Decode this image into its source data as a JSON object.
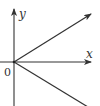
{
  "diagram": {
    "type": "coordinate-axes-with-rays",
    "axes": {
      "x_label": "x",
      "y_label": "y",
      "origin_label": "0"
    },
    "rays": [
      {
        "name": "upper-ray",
        "direction": "up-right",
        "arrow": true
      },
      {
        "name": "lower-ray",
        "direction": "down-right",
        "arrow": false
      }
    ],
    "colors": {
      "line": "#333333",
      "background": "#ffffff"
    }
  }
}
